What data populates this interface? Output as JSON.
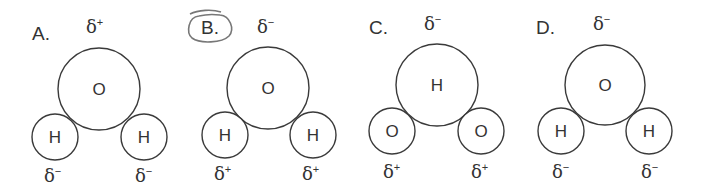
{
  "options": [
    {
      "label": "A.",
      "top_charge": {
        "symbol": "δ",
        "sign": "+"
      },
      "center_atom": "O",
      "left_atom": "H",
      "right_atom": "H",
      "left_charge": {
        "symbol": "δ",
        "sign": "−"
      },
      "right_charge": {
        "symbol": "δ",
        "sign": "−"
      },
      "circled": false
    },
    {
      "label": "B.",
      "top_charge": {
        "symbol": "δ",
        "sign": "−"
      },
      "center_atom": "O",
      "left_atom": "H",
      "right_atom": "H",
      "left_charge": {
        "symbol": "δ",
        "sign": "+"
      },
      "right_charge": {
        "symbol": "δ",
        "sign": "+"
      },
      "circled": true
    },
    {
      "label": "C.",
      "top_charge": {
        "symbol": "δ",
        "sign": "−"
      },
      "center_atom": "H",
      "left_atom": "O",
      "right_atom": "O",
      "left_charge": {
        "symbol": "δ",
        "sign": "+"
      },
      "right_charge": {
        "symbol": "δ",
        "sign": "+"
      },
      "circled": false
    },
    {
      "label": "D.",
      "top_charge": {
        "symbol": "δ",
        "sign": "−"
      },
      "center_atom": "O",
      "left_atom": "H",
      "right_atom": "H",
      "left_charge": {
        "symbol": "δ",
        "sign": "−"
      },
      "right_charge": {
        "symbol": "δ",
        "sign": "−"
      },
      "circled": false
    }
  ]
}
